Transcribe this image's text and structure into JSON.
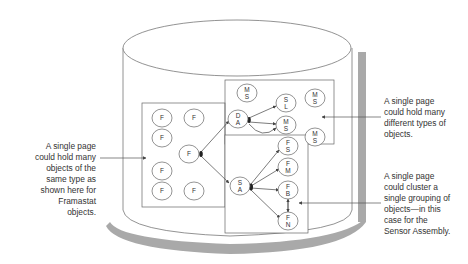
{
  "diagram": {
    "container": {
      "shape": "cylinder",
      "label": ""
    },
    "pages": [
      {
        "id": "page-framastat",
        "nodes": [
          {
            "label": [
              "F"
            ],
            "x": 162,
            "y": 118
          },
          {
            "label": [
              "F"
            ],
            "x": 194,
            "y": 118
          },
          {
            "label": [
              "F"
            ],
            "x": 162,
            "y": 138
          },
          {
            "label": [
              "F"
            ],
            "x": 189,
            "y": 154
          },
          {
            "label": [
              "F"
            ],
            "x": 162,
            "y": 171
          },
          {
            "label": [
              "F"
            ],
            "x": 162,
            "y": 191
          },
          {
            "label": [
              "F"
            ],
            "x": 194,
            "y": 191
          }
        ]
      },
      {
        "id": "page-mixed-types",
        "nodes": [
          {
            "label": [
              "M",
              "S"
            ],
            "x": 247,
            "y": 93
          },
          {
            "label": [
              "D",
              "A"
            ],
            "x": 238,
            "y": 119
          },
          {
            "label": [
              "S",
              "L"
            ],
            "x": 286,
            "y": 103
          },
          {
            "label": [
              "M",
              "S"
            ],
            "x": 286,
            "y": 125
          },
          {
            "label": [
              "M",
              "S"
            ],
            "x": 315,
            "y": 98
          },
          {
            "label": [
              "M",
              "S"
            ],
            "x": 315,
            "y": 137
          }
        ]
      },
      {
        "id": "page-sensor-assembly",
        "nodes": [
          {
            "label": [
              "F",
              "S"
            ],
            "x": 288,
            "y": 146
          },
          {
            "label": [
              "F",
              "M"
            ],
            "x": 288,
            "y": 167
          },
          {
            "label": [
              "S",
              "A"
            ],
            "x": 240,
            "y": 186
          },
          {
            "label": [
              "F",
              "B"
            ],
            "x": 288,
            "y": 190
          },
          {
            "label": [
              "F",
              "N"
            ],
            "x": 288,
            "y": 221
          }
        ]
      }
    ]
  },
  "annotations": {
    "left": {
      "lines": [
        "A single page",
        "could hold many",
        "objects of the",
        "same type as",
        "shown here for",
        "Framastat",
        "objects."
      ]
    },
    "right_top": {
      "lines": [
        "A single page",
        "could hold many",
        "different types of",
        "objects."
      ]
    },
    "right_bottom": {
      "lines": [
        "A single page",
        "could cluster a",
        "single grouping of",
        "objects—in this",
        "case for the",
        "Sensor Assembly."
      ]
    }
  },
  "colors": {
    "stroke": "#555555",
    "shadow": "#a9a9a9",
    "text": "#333333",
    "background": "#ffffff"
  }
}
